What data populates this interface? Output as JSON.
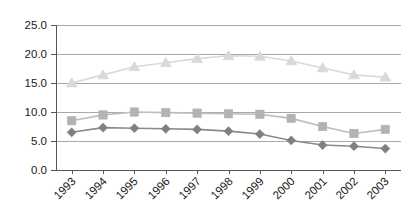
{
  "chart_data": {
    "type": "line",
    "title": "",
    "subtitle": "",
    "xlabel": "",
    "ylabel": "",
    "categories": [
      "1993",
      "1994",
      "1995",
      "1996",
      "1997",
      "1998",
      "1999",
      "2000",
      "2001",
      "2002",
      "2003"
    ],
    "ylim": [
      0.0,
      25.0
    ],
    "ytick_values": [
      0.0,
      5.0,
      10.0,
      15.0,
      20.0,
      25.0
    ],
    "ytick_labels": [
      "0.0",
      "5.0",
      "10.0",
      "15.0",
      "20.0",
      "25.0"
    ],
    "grid": true,
    "grid_axis": "y",
    "legend": false,
    "legend_position": "none",
    "series": [
      {
        "name": "series-triangle",
        "marker": "triangle",
        "color": "#d9d9d9",
        "line_color": "#d9d9d9",
        "values": [
          15.0,
          16.4,
          17.8,
          18.5,
          19.2,
          19.7,
          19.6,
          18.8,
          17.6,
          16.4,
          16.0
        ]
      },
      {
        "name": "series-square",
        "marker": "square",
        "color": "#b3b3b3",
        "line_color": "#bdbdbd",
        "values": [
          8.5,
          9.5,
          10.0,
          9.9,
          9.8,
          9.7,
          9.6,
          8.9,
          7.5,
          6.3,
          7.0
        ]
      },
      {
        "name": "series-diamond",
        "marker": "diamond",
        "color": "#808080",
        "line_color": "#8a8a8a",
        "values": [
          6.5,
          7.3,
          7.2,
          7.1,
          7.0,
          6.7,
          6.2,
          5.1,
          4.3,
          4.1,
          3.7
        ]
      }
    ]
  },
  "plot": {
    "left": 56,
    "right": 401,
    "top": 25,
    "bottom": 170
  },
  "colors": {
    "grid": "#a8a8a8",
    "axis": "#555555",
    "text": "#1a1a1a",
    "background": "#ffffff"
  }
}
